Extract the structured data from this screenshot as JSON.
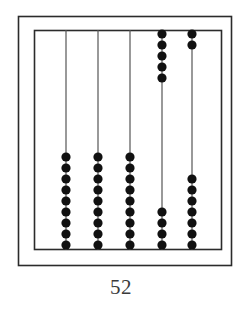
{
  "figure": {
    "name": "abacus-counting-board",
    "caption": "52",
    "colors": {
      "frame_stroke": "#2b2b2b",
      "rod_stroke": "#555555",
      "bead_fill": "#111111",
      "background": "#ffffff",
      "caption_color": "#3a3a3a"
    },
    "outer_frame": {
      "x": 18,
      "y": 16,
      "width": 214,
      "height": 250
    },
    "inner_frame": {
      "x": 34,
      "y": 30,
      "width": 188,
      "height": 220
    },
    "bead_radius": 4.6,
    "bead_spacing": 11,
    "rod_count": 5,
    "total_beads": 45,
    "rods": [
      {
        "name": "rod-1",
        "x": 66,
        "top_y": 30,
        "bottom_y": 250,
        "top_bead_count": 0,
        "bottom_bead_count": 9,
        "top_beads_y": [],
        "bottom_beads_y": [
          157,
          168,
          179,
          190,
          201,
          212,
          223,
          234,
          245
        ]
      },
      {
        "name": "rod-2",
        "x": 98,
        "top_y": 30,
        "bottom_y": 250,
        "top_bead_count": 0,
        "bottom_bead_count": 9,
        "top_beads_y": [],
        "bottom_beads_y": [
          157,
          168,
          179,
          190,
          201,
          212,
          223,
          234,
          245
        ]
      },
      {
        "name": "rod-3",
        "x": 130,
        "top_y": 30,
        "bottom_y": 250,
        "top_bead_count": 0,
        "bottom_bead_count": 9,
        "top_beads_y": [],
        "bottom_beads_y": [
          157,
          168,
          179,
          190,
          201,
          212,
          223,
          234,
          245
        ]
      },
      {
        "name": "rod-4",
        "x": 162,
        "top_y": 30,
        "bottom_y": 250,
        "top_bead_count": 5,
        "bottom_bead_count": 4,
        "top_beads_y": [
          34,
          45,
          56,
          67,
          78
        ],
        "bottom_beads_y": [
          212,
          223,
          234,
          245
        ]
      },
      {
        "name": "rod-5",
        "x": 192,
        "top_y": 30,
        "bottom_y": 250,
        "top_bead_count": 2,
        "bottom_bead_count": 7,
        "top_beads_y": [
          34,
          45
        ],
        "bottom_beads_y": [
          179,
          190,
          201,
          212,
          223,
          234,
          245
        ]
      }
    ]
  }
}
